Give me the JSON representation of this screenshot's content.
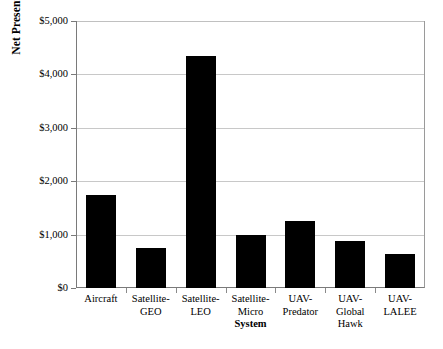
{
  "chart_data": {
    "type": "bar",
    "title": "",
    "xlabel": "System",
    "ylabel": "Net Present Cost ($M)",
    "categories": [
      "Aircraft",
      "Satellite-GEO",
      "Satellite-LEO",
      "Satellite-Micro",
      "UAV-Predator",
      "UAV-Global Hawk",
      "UAV-LALEE"
    ],
    "category_lines": [
      [
        "Aircraft"
      ],
      [
        "Satellite-",
        "GEO"
      ],
      [
        "Satellite-",
        "LEO"
      ],
      [
        "Satellite-",
        "Micro"
      ],
      [
        "UAV-",
        "Predator"
      ],
      [
        "UAV-Global",
        "Hawk"
      ],
      [
        "UAV-",
        "LALEE"
      ]
    ],
    "values": [
      1750,
      750,
      4350,
      1000,
      1260,
      880,
      640
    ],
    "ylim": [
      0,
      5000
    ],
    "ytick_values": [
      0,
      1000,
      2000,
      3000,
      4000,
      5000
    ],
    "ytick_labels": [
      "$0",
      "$1,000",
      "$2,000",
      "$3,000",
      "$4,000",
      "$5,000"
    ],
    "grid": true,
    "legend": false,
    "bar_color": "#000000",
    "gridline_color": "#c8c8c8",
    "axis_color": "#7a7a7a"
  }
}
